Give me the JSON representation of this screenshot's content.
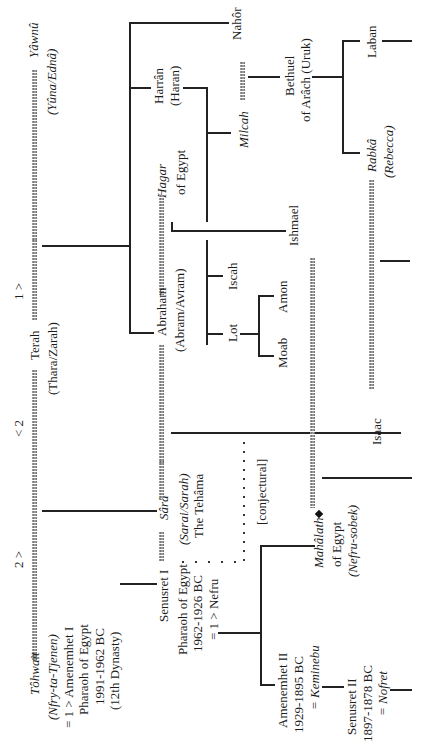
{
  "diagram": {
    "type": "genealogy-tree",
    "orientation": "rotated-90-ccw",
    "generation1": {
      "terah": {
        "name": "Terah",
        "alt": "(Thara/Zarah)"
      },
      "wife_left_marker": "< 2",
      "wife_right_marker": "1 >",
      "wife1": {
        "name": "Yâwnû",
        "alt": "(Yûna/Ednâ)",
        "marker": "1 >"
      },
      "wife2": {
        "name": "Tôhwait",
        "alt": "(Nfry-ta-Tjenen)",
        "notes": [
          "= 1 > Amenemhet I",
          "Pharaoh of Egypt",
          "1991-1962 BC",
          "(12th Dynasty)"
        ],
        "marker": "2 >"
      }
    },
    "generation2": {
      "nahor": {
        "name": "Nahôr"
      },
      "harran": {
        "name": "Harrân",
        "alt": "(Haran)"
      },
      "abraham": {
        "name": "Abraham",
        "alt": "(Abram/Avram)"
      },
      "hagar": {
        "name": "Hagar",
        "sub": "of Egypt"
      },
      "sara": {
        "name": "Sârâ",
        "alt": "(Sarai/Sarah)",
        "sub": "The Tehâma"
      },
      "senusret1": {
        "name": "Senusret I",
        "notes": [
          "Pharaoh of Egypt",
          "1962-1926 BC",
          "= 1 > Nefru"
        ]
      }
    },
    "generation3": {
      "milcah": {
        "name": "Milcah"
      },
      "bethuel": {
        "name": "Bethuel",
        "sub": "of Arâch (Uruk)"
      },
      "iscah": {
        "name": "Iscah"
      },
      "lot": {
        "name": "Lot"
      },
      "ishmael": {
        "name": "Ishmael"
      },
      "isaac": {
        "name": "Isaac"
      },
      "mahalath": {
        "name": "Mahâlath",
        "sub": "of Egypt",
        "alt": "(Nefru-sobek)"
      },
      "amenemhet2": {
        "name": "Amenemhet II",
        "notes": [
          "1929-1895 BC",
          "= Keminebu"
        ]
      },
      "conjectural": "[conjectural]"
    },
    "generation4": {
      "moab": {
        "name": "Moab"
      },
      "amon": {
        "name": "Amon"
      },
      "laban": {
        "name": "Laban"
      },
      "rebecca": {
        "name": "Rabkâ",
        "alt": "(Rebecca)"
      },
      "senusret2": {
        "name": "Senusret II",
        "notes": [
          "1897-1878 BC",
          "= Nofret"
        ]
      }
    }
  }
}
